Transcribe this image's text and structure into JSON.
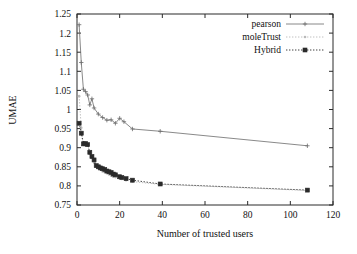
{
  "chart_data": {
    "type": "line",
    "title": "",
    "xlabel": "Number of trusted users",
    "ylabel": "UMAE",
    "xlim": [
      0,
      120
    ],
    "ylim": [
      0.75,
      1.25
    ],
    "xticks": [
      0,
      20,
      40,
      60,
      80,
      100,
      120
    ],
    "yticks": [
      0.75,
      0.8,
      0.85,
      0.9,
      0.95,
      1,
      1.05,
      1.1,
      1.15,
      1.2,
      1.25
    ],
    "xtick_labels": [
      "0",
      "20",
      "40",
      "60",
      "80",
      "100",
      "120"
    ],
    "ytick_labels": [
      "0.75",
      "0.8",
      "0.85",
      "0.9",
      "0.95",
      "1",
      "1.05",
      "1.1",
      "1.15",
      "1.2",
      "1.25"
    ],
    "grid": false,
    "legend_position": "top-right",
    "series": [
      {
        "name": "pearson",
        "color": "#6b6b6b",
        "style": "solid",
        "marker": "plus",
        "points": [
          [
            1,
            1.222
          ],
          [
            2,
            1.123
          ],
          [
            3,
            1.053
          ],
          [
            4,
            1.047
          ],
          [
            5,
            1.038
          ],
          [
            6,
            1.012
          ],
          [
            7,
            1.028
          ],
          [
            8,
            1.004
          ],
          [
            10,
            0.988
          ],
          [
            12,
            0.979
          ],
          [
            14,
            0.972
          ],
          [
            16,
            0.973
          ],
          [
            18,
            0.964
          ],
          [
            20,
            0.977
          ],
          [
            22,
            0.968
          ],
          [
            26,
            0.949
          ],
          [
            39,
            0.943
          ],
          [
            108,
            0.905
          ]
        ]
      },
      {
        "name": "moleTrust",
        "color": "#b9b9b9",
        "style": "dotted",
        "marker": "dot",
        "points": [
          [
            1,
            1.035
          ],
          [
            2,
            0.952
          ],
          [
            3,
            0.907
          ],
          [
            4,
            0.906
          ],
          [
            5,
            0.907
          ],
          [
            6,
            0.884
          ],
          [
            7,
            0.873
          ],
          [
            8,
            0.861
          ],
          [
            9,
            0.851
          ],
          [
            10,
            0.846
          ],
          [
            11,
            0.843
          ],
          [
            12,
            0.838
          ],
          [
            13,
            0.836
          ],
          [
            14,
            0.833
          ],
          [
            15,
            0.83
          ],
          [
            16,
            0.827
          ],
          [
            17,
            0.824
          ],
          [
            18,
            0.823
          ],
          [
            20,
            0.819
          ],
          [
            21,
            0.818
          ],
          [
            23,
            0.815
          ],
          [
            26,
            0.811
          ],
          [
            39,
            0.804
          ],
          [
            108,
            0.788
          ]
        ]
      },
      {
        "name": "Hybrid",
        "color": "#2a2a2a",
        "style": "dotted",
        "marker": "square",
        "points": [
          [
            1,
            0.964
          ],
          [
            2,
            0.938
          ],
          [
            3,
            0.91
          ],
          [
            4,
            0.911
          ],
          [
            5,
            0.908
          ],
          [
            6,
            0.888
          ],
          [
            7,
            0.877
          ],
          [
            8,
            0.868
          ],
          [
            9,
            0.853
          ],
          [
            10,
            0.85
          ],
          [
            11,
            0.847
          ],
          [
            12,
            0.845
          ],
          [
            13,
            0.843
          ],
          [
            14,
            0.839
          ],
          [
            15,
            0.837
          ],
          [
            16,
            0.835
          ],
          [
            17,
            0.831
          ],
          [
            18,
            0.829
          ],
          [
            20,
            0.824
          ],
          [
            21,
            0.822
          ],
          [
            23,
            0.819
          ],
          [
            26,
            0.815
          ],
          [
            39,
            0.805
          ],
          [
            108,
            0.789
          ]
        ]
      }
    ],
    "legend": [
      {
        "label": "pearson",
        "style": "solid",
        "marker": "plus",
        "color": "#6b6b6b"
      },
      {
        "label": "moleTrust",
        "style": "dotted",
        "marker": "dot",
        "color": "#b9b9b9"
      },
      {
        "label": "Hybrid",
        "style": "dotted",
        "marker": "square",
        "color": "#2a2a2a"
      }
    ]
  }
}
